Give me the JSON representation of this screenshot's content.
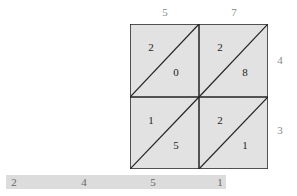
{
  "diagram": {
    "type": "lattice-multiplication",
    "top_digits": [
      "5",
      "7"
    ],
    "right_digits": [
      "4",
      "3"
    ],
    "cells": [
      {
        "row": 0,
        "col": 0,
        "tens": "2",
        "ones": "0"
      },
      {
        "row": 0,
        "col": 1,
        "tens": "2",
        "ones": "8"
      },
      {
        "row": 1,
        "col": 0,
        "tens": "1",
        "ones": "5"
      },
      {
        "row": 1,
        "col": 1,
        "tens": "2",
        "ones": "1"
      }
    ],
    "result_digits": [
      "2",
      "4",
      "5",
      "1"
    ],
    "colors": {
      "cell_fill": "#e2e2e2",
      "line": "#222222",
      "result_bar": "#dcdcdc"
    }
  }
}
